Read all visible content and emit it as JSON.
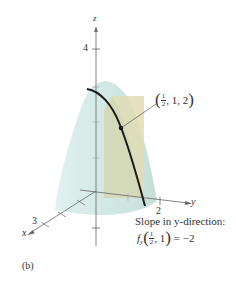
{
  "figure": {
    "panel_label": "(b)",
    "axes": {
      "x_label": "x",
      "y_label": "y",
      "z_label": "z",
      "x_tick_label": "3",
      "y_tick_label": "2",
      "z_tick_label": "4"
    },
    "point_annotation": {
      "frac_num": "1",
      "frac_den": "2",
      "rest": ", 1, 2",
      "open": "(",
      "close": ")"
    },
    "slope_caption": {
      "line1": "Slope in y-direction:",
      "func": "f",
      "sub": "y",
      "frac_num": "1",
      "frac_den": "2",
      "arg_rest": ", 1",
      "result": " = −2",
      "open": "(",
      "close": ")"
    },
    "colors": {
      "surface": "#d3e9e6",
      "plane": "#e5e1bc",
      "curve": "#1a1a1a",
      "axis": "#666666"
    }
  }
}
